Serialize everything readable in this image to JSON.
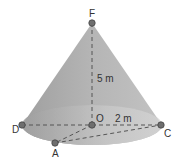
{
  "diagram": {
    "type": "cone",
    "points": {
      "F": {
        "label": "F"
      },
      "O": {
        "label": "O"
      },
      "D": {
        "label": "D"
      },
      "C": {
        "label": "C"
      },
      "A": {
        "label": "A"
      }
    },
    "height_label": "5 m",
    "radius_label": "2 m",
    "colors": {
      "cone_fill": "#9a9a9a",
      "base_fill": "#c8c8c8",
      "point_fill": "#6e6e6e",
      "dash": "#555555"
    }
  }
}
